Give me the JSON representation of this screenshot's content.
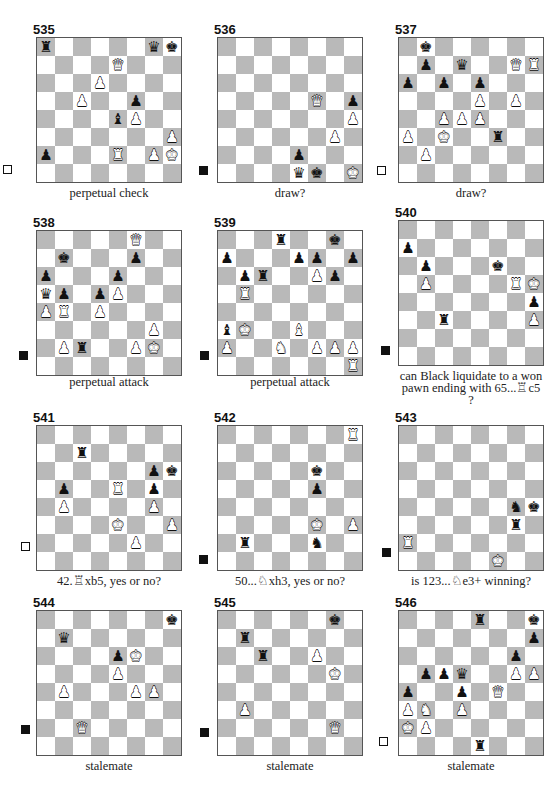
{
  "page": {
    "colors": {
      "light_square": "#ffffff",
      "dark_square": "#b9b9b9",
      "ink": "#111111"
    }
  },
  "diagrams": [
    {
      "number": "535",
      "to_move": "white",
      "caption": "perpetual check",
      "pieces": [
        {
          "sq": "a8",
          "p": "r",
          "c": "b"
        },
        {
          "sq": "g8",
          "p": "q",
          "c": "b"
        },
        {
          "sq": "h8",
          "p": "k",
          "c": "b"
        },
        {
          "sq": "e7",
          "p": "q",
          "c": "w"
        },
        {
          "sq": "d6",
          "p": "p",
          "c": "w"
        },
        {
          "sq": "c5",
          "p": "p",
          "c": "w"
        },
        {
          "sq": "f5",
          "p": "p",
          "c": "b"
        },
        {
          "sq": "e4",
          "p": "b",
          "c": "b"
        },
        {
          "sq": "f4",
          "p": "p",
          "c": "w"
        },
        {
          "sq": "h3",
          "p": "p",
          "c": "w"
        },
        {
          "sq": "a2",
          "p": "p",
          "c": "b"
        },
        {
          "sq": "e2",
          "p": "r",
          "c": "w"
        },
        {
          "sq": "g2",
          "p": "p",
          "c": "w"
        },
        {
          "sq": "h2",
          "p": "k",
          "c": "w"
        }
      ]
    },
    {
      "number": "536",
      "to_move": "black",
      "caption": "draw?",
      "pieces": [
        {
          "sq": "f5",
          "p": "q",
          "c": "w"
        },
        {
          "sq": "h5",
          "p": "p",
          "c": "b"
        },
        {
          "sq": "h4",
          "p": "p",
          "c": "w"
        },
        {
          "sq": "g3",
          "p": "p",
          "c": "w"
        },
        {
          "sq": "e2",
          "p": "p",
          "c": "b"
        },
        {
          "sq": "e1",
          "p": "q",
          "c": "b"
        },
        {
          "sq": "f1",
          "p": "k",
          "c": "b"
        },
        {
          "sq": "h1",
          "p": "k",
          "c": "w"
        }
      ]
    },
    {
      "number": "537",
      "to_move": "white",
      "caption": "draw?",
      "pieces": [
        {
          "sq": "b8",
          "p": "k",
          "c": "b"
        },
        {
          "sq": "b7",
          "p": "p",
          "c": "b"
        },
        {
          "sq": "d7",
          "p": "q",
          "c": "b"
        },
        {
          "sq": "g7",
          "p": "q",
          "c": "w"
        },
        {
          "sq": "h7",
          "p": "r",
          "c": "w"
        },
        {
          "sq": "a6",
          "p": "p",
          "c": "b"
        },
        {
          "sq": "c6",
          "p": "p",
          "c": "b"
        },
        {
          "sq": "e6",
          "p": "p",
          "c": "b"
        },
        {
          "sq": "e5",
          "p": "p",
          "c": "w"
        },
        {
          "sq": "g5",
          "p": "p",
          "c": "w"
        },
        {
          "sq": "c4",
          "p": "p",
          "c": "w"
        },
        {
          "sq": "d4",
          "p": "p",
          "c": "w"
        },
        {
          "sq": "e4",
          "p": "p",
          "c": "w"
        },
        {
          "sq": "a3",
          "p": "p",
          "c": "w"
        },
        {
          "sq": "c3",
          "p": "k",
          "c": "w"
        },
        {
          "sq": "f3",
          "p": "r",
          "c": "b"
        },
        {
          "sq": "b2",
          "p": "p",
          "c": "w"
        }
      ]
    },
    {
      "number": "538",
      "to_move": "black",
      "caption": "perpetual attack",
      "pieces": [
        {
          "sq": "f8",
          "p": "q",
          "c": "w"
        },
        {
          "sq": "b7",
          "p": "k",
          "c": "b"
        },
        {
          "sq": "f7",
          "p": "p",
          "c": "b"
        },
        {
          "sq": "a6",
          "p": "p",
          "c": "b"
        },
        {
          "sq": "e6",
          "p": "p",
          "c": "b"
        },
        {
          "sq": "a5",
          "p": "q",
          "c": "b"
        },
        {
          "sq": "b5",
          "p": "p",
          "c": "b"
        },
        {
          "sq": "d5",
          "p": "p",
          "c": "b"
        },
        {
          "sq": "e5",
          "p": "p",
          "c": "w"
        },
        {
          "sq": "a4",
          "p": "p",
          "c": "w"
        },
        {
          "sq": "b4",
          "p": "r",
          "c": "w"
        },
        {
          "sq": "d4",
          "p": "p",
          "c": "w"
        },
        {
          "sq": "g3",
          "p": "p",
          "c": "w"
        },
        {
          "sq": "b2",
          "p": "p",
          "c": "w"
        },
        {
          "sq": "c2",
          "p": "r",
          "c": "b"
        },
        {
          "sq": "f2",
          "p": "p",
          "c": "w"
        },
        {
          "sq": "g2",
          "p": "k",
          "c": "w"
        }
      ]
    },
    {
      "number": "539",
      "to_move": "black",
      "caption": "perpetual attack",
      "pieces": [
        {
          "sq": "d8",
          "p": "r",
          "c": "b"
        },
        {
          "sq": "g8",
          "p": "k",
          "c": "b"
        },
        {
          "sq": "a7",
          "p": "p",
          "c": "b"
        },
        {
          "sq": "e7",
          "p": "p",
          "c": "b"
        },
        {
          "sq": "f7",
          "p": "p",
          "c": "b"
        },
        {
          "sq": "h7",
          "p": "p",
          "c": "b"
        },
        {
          "sq": "b6",
          "p": "p",
          "c": "b"
        },
        {
          "sq": "c6",
          "p": "r",
          "c": "b"
        },
        {
          "sq": "f6",
          "p": "p",
          "c": "w"
        },
        {
          "sq": "g6",
          "p": "p",
          "c": "b"
        },
        {
          "sq": "b5",
          "p": "r",
          "c": "w"
        },
        {
          "sq": "a3",
          "p": "b",
          "c": "b"
        },
        {
          "sq": "b3",
          "p": "k",
          "c": "w"
        },
        {
          "sq": "e3",
          "p": "b",
          "c": "w"
        },
        {
          "sq": "a2",
          "p": "p",
          "c": "w"
        },
        {
          "sq": "d2",
          "p": "n",
          "c": "w"
        },
        {
          "sq": "f2",
          "p": "p",
          "c": "w"
        },
        {
          "sq": "g2",
          "p": "p",
          "c": "w"
        },
        {
          "sq": "h2",
          "p": "p",
          "c": "w"
        },
        {
          "sq": "h1",
          "p": "r",
          "c": "w"
        }
      ]
    },
    {
      "number": "540",
      "to_move": "black",
      "caption": "can Black liquidate to a won pawn ending with 65...♖c5 ?",
      "pieces": [
        {
          "sq": "a7",
          "p": "p",
          "c": "b"
        },
        {
          "sq": "b6",
          "p": "p",
          "c": "b"
        },
        {
          "sq": "f6",
          "p": "k",
          "c": "b"
        },
        {
          "sq": "b5",
          "p": "p",
          "c": "w"
        },
        {
          "sq": "g5",
          "p": "r",
          "c": "w"
        },
        {
          "sq": "h5",
          "p": "k",
          "c": "w"
        },
        {
          "sq": "h4",
          "p": "p",
          "c": "b"
        },
        {
          "sq": "c3",
          "p": "r",
          "c": "b"
        },
        {
          "sq": "h3",
          "p": "p",
          "c": "w"
        }
      ]
    },
    {
      "number": "541",
      "to_move": "white",
      "caption": "42.♖xb5, yes or no?",
      "pieces": [
        {
          "sq": "c7",
          "p": "r",
          "c": "b"
        },
        {
          "sq": "g6",
          "p": "p",
          "c": "b"
        },
        {
          "sq": "h6",
          "p": "k",
          "c": "b"
        },
        {
          "sq": "b5",
          "p": "p",
          "c": "b"
        },
        {
          "sq": "e5",
          "p": "r",
          "c": "w"
        },
        {
          "sq": "g5",
          "p": "p",
          "c": "b"
        },
        {
          "sq": "b4",
          "p": "p",
          "c": "w"
        },
        {
          "sq": "g4",
          "p": "p",
          "c": "w"
        },
        {
          "sq": "e3",
          "p": "k",
          "c": "w"
        },
        {
          "sq": "h3",
          "p": "p",
          "c": "w"
        },
        {
          "sq": "f2",
          "p": "p",
          "c": "w"
        }
      ]
    },
    {
      "number": "542",
      "to_move": "black",
      "caption": "50...♘xh3, yes or no?",
      "pieces": [
        {
          "sq": "h8",
          "p": "r",
          "c": "w"
        },
        {
          "sq": "f6",
          "p": "k",
          "c": "b"
        },
        {
          "sq": "f5",
          "p": "p",
          "c": "b"
        },
        {
          "sq": "f3",
          "p": "k",
          "c": "w"
        },
        {
          "sq": "h3",
          "p": "p",
          "c": "w"
        },
        {
          "sq": "b2",
          "p": "r",
          "c": "b"
        },
        {
          "sq": "f2",
          "p": "n",
          "c": "b"
        }
      ]
    },
    {
      "number": "543",
      "to_move": "black",
      "caption": "is 123...♘e3+ winning?",
      "pieces": [
        {
          "sq": "g4",
          "p": "n",
          "c": "b"
        },
        {
          "sq": "h4",
          "p": "k",
          "c": "b"
        },
        {
          "sq": "g3",
          "p": "r",
          "c": "b"
        },
        {
          "sq": "a2",
          "p": "r",
          "c": "w"
        },
        {
          "sq": "f1",
          "p": "k",
          "c": "w"
        }
      ]
    },
    {
      "number": "544",
      "to_move": "black",
      "caption": "stalemate",
      "pieces": [
        {
          "sq": "h8",
          "p": "k",
          "c": "b"
        },
        {
          "sq": "b7",
          "p": "q",
          "c": "b"
        },
        {
          "sq": "e6",
          "p": "p",
          "c": "b"
        },
        {
          "sq": "f6",
          "p": "k",
          "c": "w"
        },
        {
          "sq": "e5",
          "p": "p",
          "c": "w"
        },
        {
          "sq": "b4",
          "p": "p",
          "c": "w"
        },
        {
          "sq": "f4",
          "p": "p",
          "c": "w"
        },
        {
          "sq": "g4",
          "p": "p",
          "c": "w"
        },
        {
          "sq": "c2",
          "p": "q",
          "c": "w"
        }
      ]
    },
    {
      "number": "545",
      "to_move": "black",
      "caption": "stalemate",
      "pieces": [
        {
          "sq": "g8",
          "p": "k",
          "c": "b"
        },
        {
          "sq": "b7",
          "p": "r",
          "c": "b"
        },
        {
          "sq": "c6",
          "p": "r",
          "c": "b"
        },
        {
          "sq": "f6",
          "p": "p",
          "c": "w"
        },
        {
          "sq": "g5",
          "p": "k",
          "c": "w"
        },
        {
          "sq": "b3",
          "p": "p",
          "c": "w"
        },
        {
          "sq": "g2",
          "p": "q",
          "c": "w"
        }
      ]
    },
    {
      "number": "546",
      "to_move": "white",
      "caption": "stalemate",
      "pieces": [
        {
          "sq": "e8",
          "p": "r",
          "c": "b"
        },
        {
          "sq": "h8",
          "p": "k",
          "c": "b"
        },
        {
          "sq": "h7",
          "p": "p",
          "c": "b"
        },
        {
          "sq": "g6",
          "p": "p",
          "c": "b"
        },
        {
          "sq": "b5",
          "p": "p",
          "c": "b"
        },
        {
          "sq": "c5",
          "p": "p",
          "c": "b"
        },
        {
          "sq": "d5",
          "p": "q",
          "c": "b"
        },
        {
          "sq": "g5",
          "p": "p",
          "c": "w"
        },
        {
          "sq": "h5",
          "p": "p",
          "c": "w"
        },
        {
          "sq": "a4",
          "p": "p",
          "c": "b"
        },
        {
          "sq": "d4",
          "p": "p",
          "c": "b"
        },
        {
          "sq": "f4",
          "p": "q",
          "c": "w"
        },
        {
          "sq": "a3",
          "p": "p",
          "c": "w"
        },
        {
          "sq": "b3",
          "p": "n",
          "c": "w"
        },
        {
          "sq": "d3",
          "p": "p",
          "c": "w"
        },
        {
          "sq": "a2",
          "p": "k",
          "c": "w"
        },
        {
          "sq": "b2",
          "p": "p",
          "c": "w"
        },
        {
          "sq": "e1",
          "p": "r",
          "c": "b"
        }
      ]
    }
  ],
  "glyphs": {
    "k": "♚",
    "q": "♛",
    "r": "♜",
    "b": "♝",
    "n": "♞",
    "p": "♟"
  }
}
